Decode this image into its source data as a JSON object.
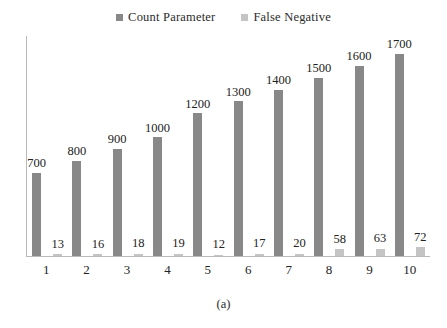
{
  "chart_data": {
    "type": "bar",
    "title": "",
    "subtitle": "",
    "xlabel": "",
    "ylabel": "",
    "caption": "(a)",
    "categories": [
      "1",
      "2",
      "3",
      "4",
      "5",
      "6",
      "7",
      "8",
      "9",
      "10"
    ],
    "series": [
      {
        "name": "Count Parameter",
        "color": "#888888",
        "values": [
          700,
          800,
          900,
          1000,
          1200,
          1300,
          1400,
          1500,
          1600,
          1700
        ]
      },
      {
        "name": "False Negative",
        "color": "#c4c4c4",
        "values": [
          13,
          16,
          18,
          19,
          12,
          17,
          20,
          58,
          63,
          72
        ]
      }
    ],
    "ylim": [
      0,
      1850
    ],
    "grid": false,
    "legend_position": "top-center",
    "axis_color": "#b9b9b9"
  },
  "legend": {
    "entries": [
      {
        "label": "Count Parameter",
        "swatch_icon": "square-marker-dark"
      },
      {
        "label": "False Negative",
        "swatch_icon": "square-marker-light"
      }
    ]
  }
}
